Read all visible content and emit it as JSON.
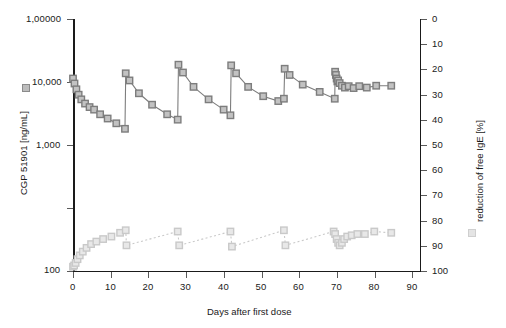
{
  "chart_data": {
    "type": "scatter",
    "title": "",
    "xlabel": "Days after first dose",
    "ylabel_left": "CGP 51901 [ng/mL]",
    "ylabel_right": "reduction of free IgE [%]",
    "xlim": [
      0,
      92
    ],
    "xticks": [
      0,
      10,
      20,
      30,
      40,
      50,
      60,
      70,
      80,
      90
    ],
    "xtick_labels": [
      "0",
      "10",
      "20",
      "30",
      "40",
      "50",
      "60",
      "70",
      "80",
      "90"
    ],
    "left_axis": {
      "scale": "log",
      "ylim": [
        100,
        100000
      ],
      "yticks": [
        100000,
        10000,
        1000,
        100
      ],
      "ytick_labels": [
        "1,00000",
        "10,000",
        "1,000",
        "100"
      ]
    },
    "right_axis": {
      "scale": "linear",
      "ylim": [
        100,
        0
      ],
      "yticks": [
        0,
        10,
        20,
        30,
        40,
        50,
        60,
        70,
        80,
        90,
        100
      ],
      "ytick_labels": [
        "0",
        "10",
        "20",
        "30",
        "40",
        "50",
        "60",
        "70",
        "80",
        "90",
        "100"
      ],
      "inverted": true
    },
    "grid": false,
    "legend_position": "outside-left-and-right",
    "series": [
      {
        "name": "CGP 51901 [ng/mL]",
        "axis": "left",
        "marker": "open-square-dark",
        "line": "solid",
        "x": [
          0.0,
          0.4,
          0.9,
          1.5,
          2.2,
          3.2,
          4.4,
          5.6,
          7.2,
          9.2,
          11.5,
          13.8,
          14.0,
          15.0,
          17.5,
          21.0,
          25.0,
          27.8,
          28.0,
          29.2,
          32.0,
          36.0,
          40.0,
          41.8,
          42.0,
          43.3,
          46.5,
          50.5,
          54.5,
          56.0,
          56.2,
          57.5,
          61.0,
          65.5,
          69.5,
          69.6,
          69.8,
          70.0,
          70.2,
          70.4,
          70.8,
          71.4,
          72.2,
          73.2,
          74.5,
          76.0,
          78.0,
          80.5,
          84.5
        ],
        "y": [
          19500,
          17000,
          14500,
          12500,
          11000,
          9800,
          8900,
          8300,
          7300,
          6500,
          5700,
          4900,
          22500,
          18500,
          13000,
          9500,
          7300,
          6300,
          28500,
          23000,
          15500,
          11000,
          8300,
          7100,
          28000,
          22500,
          15500,
          12000,
          10500,
          11200,
          25500,
          21500,
          16500,
          13500,
          11200,
          23500,
          21500,
          19500,
          18000,
          18500,
          17200,
          16000,
          15200,
          15800,
          15000,
          15800,
          15200,
          16000,
          16000
        ]
      },
      {
        "name": "reduction of free IgE [%]",
        "axis": "right",
        "marker": "open-square-light",
        "line": "dotted",
        "x": [
          0.0,
          0.3,
          0.7,
          1.2,
          1.8,
          2.6,
          3.6,
          4.8,
          6.2,
          8.0,
          10.2,
          12.5,
          14.0,
          14.2,
          27.8,
          28.2,
          41.8,
          42.2,
          56.0,
          56.4,
          69.2,
          69.6,
          70.0,
          70.4,
          70.8,
          71.4,
          72.0,
          72.8,
          74.0,
          75.5,
          77.5,
          80.0,
          84.5
        ],
        "y": [
          98.5,
          98.0,
          97.0,
          95.5,
          94.0,
          92.5,
          91.0,
          89.5,
          88.5,
          87.5,
          86.5,
          85.0,
          84.0,
          90.0,
          84.5,
          90.0,
          84.5,
          90.5,
          84.0,
          90.0,
          84.5,
          85.5,
          87.5,
          89.0,
          90.0,
          89.0,
          87.5,
          86.5,
          86.0,
          85.5,
          85.5,
          84.5,
          85.0
        ]
      }
    ],
    "annotations": {
      "dose_days": [
        0,
        14,
        28,
        42,
        56,
        70
      ],
      "pattern": "sawtooth: drug concentration rises at each dose then declines; IgE reduction sustained near 85-90%"
    }
  },
  "legend": {
    "left_marker_name": "cgp-51901-legend-marker",
    "right_marker_name": "ige-reduction-legend-marker"
  }
}
